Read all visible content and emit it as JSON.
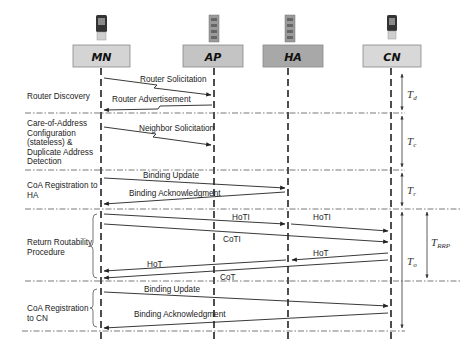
{
  "entities": [
    {
      "id": "MN",
      "label": "MN",
      "x": 101,
      "box_fill": "#d4d4d4",
      "device": "phone"
    },
    {
      "id": "AP",
      "label": "AP",
      "x": 214,
      "box_fill": "#c4c4c4",
      "device": "access-point"
    },
    {
      "id": "HA",
      "label": "HA",
      "x": 288,
      "box_fill": "#a8a8a8",
      "device": "access-point"
    },
    {
      "id": "CN",
      "label": "CN",
      "x": 391,
      "box_fill": "#d8d8d8",
      "device": "phone"
    }
  ],
  "phases": [
    {
      "id": "router-discovery",
      "lines": [
        "Router Discovery"
      ],
      "timing": "T",
      "timing_sub": "d"
    },
    {
      "id": "coa-config",
      "lines": [
        "Care-of-Address",
        "Configuration",
        "(stateless) &",
        "Duplicate Address",
        "Detection"
      ],
      "timing": "T",
      "timing_sub": "c"
    },
    {
      "id": "coa-registration-ha",
      "lines": [
        "CoA Registration to",
        "HA"
      ],
      "timing": "T",
      "timing_sub": "r"
    },
    {
      "id": "return-routability",
      "lines": [
        "Return Routability",
        "Procedure"
      ],
      "timing": "T",
      "timing_sub": "RRP"
    },
    {
      "id": "coa-registration-cn",
      "lines": [
        "CoA Registration",
        "to CN"
      ],
      "timing": "T",
      "timing_sub": "o"
    }
  ],
  "messages": [
    {
      "label": "Router Solicitation",
      "from": "MN",
      "to": "AP",
      "wireless": true
    },
    {
      "label": "Router Advertisement",
      "from": "AP",
      "to": "MN",
      "wireless": true
    },
    {
      "label": "Neighbor Solicitation",
      "from": "MN",
      "to": "AP",
      "wireless": true
    },
    {
      "label": "Binding Update",
      "from": "MN",
      "to": "HA"
    },
    {
      "label": "Binding Acknowledgment",
      "from": "HA",
      "to": "MN"
    },
    {
      "label": "HoTI",
      "from": "MN",
      "to": "HA"
    },
    {
      "label": "HoTI",
      "from": "HA",
      "to": "CN"
    },
    {
      "label": "CoTI",
      "from": "MN",
      "to": "CN"
    },
    {
      "label": "HoT",
      "from": "CN",
      "to": "HA"
    },
    {
      "label": "HoT",
      "from": "HA",
      "to": "MN"
    },
    {
      "label": "CoT",
      "from": "CN",
      "to": "MN"
    },
    {
      "label": "Binding Update",
      "from": "MN",
      "to": "CN"
    },
    {
      "label": "Binding Acknowledgment",
      "from": "CN",
      "to": "MN"
    }
  ],
  "timings": {
    "Td": {
      "main": "T",
      "sub": "d"
    },
    "Tc": {
      "main": "T",
      "sub": "c"
    },
    "Tr": {
      "main": "T",
      "sub": "r"
    },
    "To": {
      "main": "T",
      "sub": "o"
    },
    "TRRP": {
      "main": "T",
      "sub": "RRP"
    }
  },
  "colors": {
    "line": "#222222",
    "separator": "#444444",
    "text": "#222222"
  }
}
